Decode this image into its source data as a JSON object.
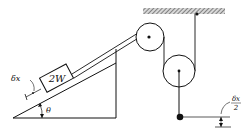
{
  "diagram": {
    "type": "mechanics-pulley-incline",
    "block_label": "2W",
    "angle_label": "θ",
    "displacement_label": "δx",
    "hanging_displacement_numerator": "δx",
    "hanging_displacement_denominator": "2",
    "colors": {
      "ink": "#111111",
      "background": "#ffffff",
      "hatch": "#555555"
    }
  }
}
